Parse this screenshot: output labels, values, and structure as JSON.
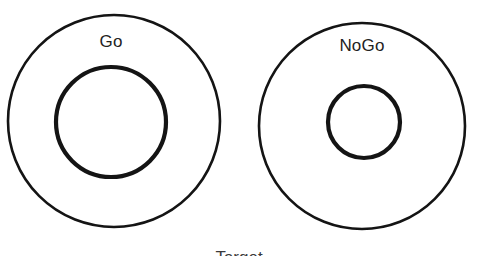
{
  "figure": {
    "background_color": "#ffffff",
    "stroke_color": "#141414",
    "caption": "Target",
    "caption_note": "clipped by bottom image edge"
  },
  "diagram": {
    "type": "concentric-rings",
    "panels": [
      {
        "id": "go",
        "label": "Go",
        "outer_circle": {
          "cx": 114,
          "cy": 121,
          "r": 106,
          "stroke_width": 2.6
        },
        "inner_circle": {
          "cx": 111,
          "cy": 122,
          "r": 55,
          "stroke_width": 4.2
        },
        "label_position": {
          "x": 111,
          "y": 42
        }
      },
      {
        "id": "nogo",
        "label": "NoGo",
        "outer_circle": {
          "cx": 362,
          "cy": 126,
          "r": 103,
          "stroke_width": 2.6
        },
        "inner_circle": {
          "cx": 364,
          "cy": 122,
          "r": 36,
          "stroke_width": 4.2
        },
        "label_position": {
          "x": 362,
          "y": 46
        }
      }
    ]
  }
}
